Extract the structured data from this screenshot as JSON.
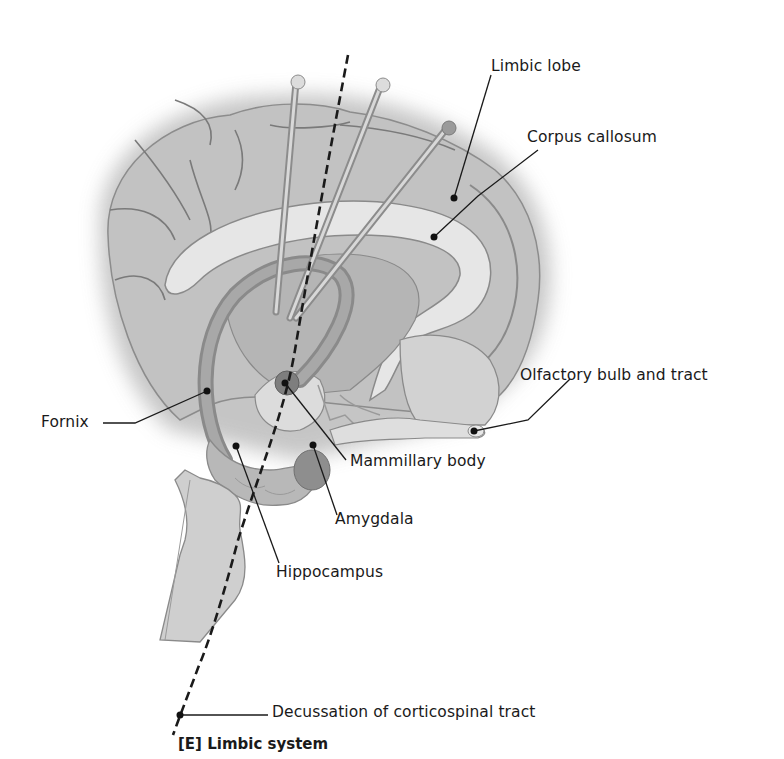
{
  "figure": {
    "caption": "[E] Limbic system",
    "labels": {
      "limbic_lobe": "Limbic lobe",
      "corpus_callosum": "Corpus callosum",
      "olfactory": "Olfactory bulb and tract",
      "fornix": "Fornix",
      "mammillary_body": "Mammillary body",
      "amygdala": "Amygdala",
      "hippocampus": "Hippocampus",
      "decussation": "Decussation of corticospinal tract"
    }
  }
}
